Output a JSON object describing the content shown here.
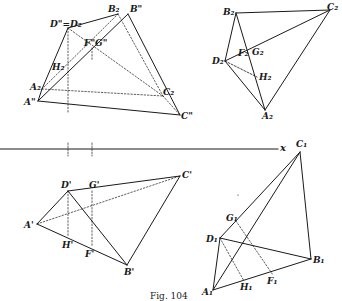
{
  "figure": {
    "caption": "Fig. 104",
    "axis_label": "x",
    "colors": {
      "ink": "#1a1a1a",
      "background": "#ffffff"
    }
  },
  "views": {
    "elevation_top_left": {
      "points": [
        {
          "id": "A2pp",
          "label": "A\"",
          "x": 38,
          "y": 101,
          "lx": 24,
          "ly": 98
        },
        {
          "id": "A2",
          "label": "A₂",
          "x": 42,
          "y": 89,
          "lx": 30,
          "ly": 83
        },
        {
          "id": "D",
          "label": "D\"=D₂",
          "x": 68,
          "y": 28,
          "lx": 50,
          "ly": 20
        },
        {
          "id": "B2",
          "label": "B₂",
          "x": 118,
          "y": 14,
          "lx": 108,
          "ly": 5
        },
        {
          "id": "Bpp",
          "label": "B\"",
          "x": 128,
          "y": 14,
          "lx": 130,
          "ly": 5
        },
        {
          "id": "FG",
          "label": "F\"G\"",
          "x": 96,
          "y": 48,
          "lx": 84,
          "ly": 39
        },
        {
          "id": "H2",
          "label": "H₂",
          "x": 68,
          "y": 68,
          "lx": 52,
          "ly": 63
        },
        {
          "id": "C2",
          "label": "C₂",
          "x": 163,
          "y": 96,
          "lx": 163,
          "ly": 88
        },
        {
          "id": "Cpp",
          "label": "C\"",
          "x": 180,
          "y": 115,
          "lx": 181,
          "ly": 112
        }
      ]
    },
    "top_right": {
      "points": [
        {
          "id": "B2",
          "label": "B₂",
          "x": 236,
          "y": 13,
          "lx": 223,
          "ly": 8
        },
        {
          "id": "C2",
          "label": "C₂",
          "x": 330,
          "y": 10,
          "lx": 327,
          "ly": 3
        },
        {
          "id": "D2",
          "label": "D₂",
          "x": 225,
          "y": 61,
          "lx": 212,
          "ly": 57
        },
        {
          "id": "F2",
          "label": "F₂",
          "x": 244,
          "y": 55,
          "lx": 238,
          "ly": 49
        },
        {
          "id": "G2",
          "label": "G₂",
          "x": 252,
          "y": 52,
          "lx": 252,
          "ly": 48
        },
        {
          "id": "H2",
          "label": "H₂",
          "x": 257,
          "y": 77,
          "lx": 259,
          "ly": 73
        },
        {
          "id": "A2",
          "label": "A₂",
          "x": 265,
          "y": 110,
          "lx": 262,
          "ly": 112
        }
      ]
    },
    "plan_bottom_left": {
      "points": [
        {
          "id": "D1p",
          "label": "D'",
          "x": 68,
          "y": 191,
          "lx": 61,
          "ly": 181
        },
        {
          "id": "G1p",
          "label": "G'",
          "x": 92,
          "y": 191,
          "lx": 89,
          "ly": 181
        },
        {
          "id": "Cp",
          "label": "C'",
          "x": 180,
          "y": 176,
          "lx": 182,
          "ly": 171
        },
        {
          "id": "Ap",
          "label": "A'",
          "x": 37,
          "y": 224,
          "lx": 24,
          "ly": 221
        },
        {
          "id": "Hp",
          "label": "H'",
          "x": 68,
          "y": 237,
          "lx": 62,
          "ly": 241
        },
        {
          "id": "Fp",
          "label": "F'",
          "x": 92,
          "y": 246,
          "lx": 85,
          "ly": 250
        },
        {
          "id": "Bp",
          "label": "B'",
          "x": 127,
          "y": 265,
          "lx": 124,
          "ly": 268
        }
      ]
    },
    "bottom_right": {
      "points": [
        {
          "id": "C1",
          "label": "C₁",
          "x": 300,
          "y": 152,
          "lx": 296,
          "ly": 140
        },
        {
          "id": "G1",
          "label": "G₁",
          "x": 236,
          "y": 221,
          "lx": 226,
          "ly": 214
        },
        {
          "id": "D1",
          "label": "D₁",
          "x": 220,
          "y": 238,
          "lx": 206,
          "ly": 235
        },
        {
          "id": "B1",
          "label": "B₁",
          "x": 311,
          "y": 259,
          "lx": 313,
          "ly": 256
        },
        {
          "id": "F1",
          "label": "F₁",
          "x": 273,
          "y": 275,
          "lx": 267,
          "ly": 277
        },
        {
          "id": "H1",
          "label": "H₁",
          "x": 244,
          "y": 281,
          "lx": 240,
          "ly": 283
        },
        {
          "id": "A1",
          "label": "A₁",
          "x": 213,
          "y": 290,
          "lx": 202,
          "ly": 288
        }
      ]
    }
  }
}
